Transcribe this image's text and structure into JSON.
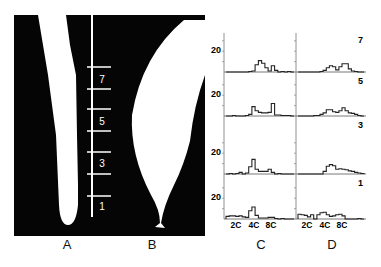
{
  "figure": {
    "panel_labels": [
      "A",
      "B",
      "C",
      "D"
    ],
    "scale_marks": [
      "7",
      "5",
      "3",
      "1"
    ]
  },
  "chart_data": [
    {
      "type": "histogram",
      "panel": "C",
      "rows": [
        {
          "row_label": "7",
          "y_tick": "20",
          "bins": [
            0,
            0,
            0,
            0,
            0,
            0,
            0,
            1,
            2,
            14,
            22,
            17,
            8,
            2,
            12,
            3,
            0,
            1,
            0,
            1,
            0
          ]
        },
        {
          "row_label": "5",
          "y_tick": "20",
          "bins": [
            0,
            0,
            1,
            0,
            0,
            0,
            1,
            3,
            18,
            10,
            7,
            6,
            6,
            7,
            24,
            2,
            2,
            1,
            1,
            1,
            0
          ]
        },
        {
          "row_label": "3",
          "y_tick": "20",
          "bins": [
            0,
            1,
            0,
            1,
            3,
            0,
            2,
            14,
            28,
            9,
            5,
            5,
            5,
            9,
            3,
            0,
            1,
            0,
            0,
            0,
            0
          ]
        },
        {
          "row_label": "1",
          "y_tick": "20",
          "bins": [
            5,
            6,
            6,
            5,
            6,
            4,
            3,
            16,
            23,
            7,
            2,
            2,
            2,
            3,
            3,
            1,
            0,
            1,
            0,
            0,
            0
          ]
        }
      ],
      "x_tick_labels": [
        "2C",
        "4C",
        "8C"
      ],
      "y_tick_labels": [
        "20"
      ],
      "xlabel": "C"
    },
    {
      "type": "histogram",
      "panel": "D",
      "rows": [
        {
          "row_label": "7",
          "bins": [
            0,
            0,
            0,
            0,
            0,
            0,
            0,
            1,
            3,
            8,
            12,
            10,
            4,
            10,
            16,
            16,
            6,
            2,
            1,
            0,
            0
          ]
        },
        {
          "row_label": "5",
          "bins": [
            0,
            0,
            0,
            0,
            0,
            1,
            1,
            3,
            6,
            12,
            12,
            8,
            7,
            10,
            16,
            10,
            6,
            5,
            3,
            1,
            0
          ]
        },
        {
          "row_label": "3",
          "bins": [
            0,
            0,
            0,
            0,
            0,
            0,
            0,
            0,
            5,
            15,
            18,
            16,
            9,
            10,
            9,
            8,
            6,
            5,
            3,
            2,
            1
          ]
        },
        {
          "row_label": "1",
          "bins": [
            9,
            8,
            7,
            4,
            8,
            0,
            8,
            12,
            13,
            8,
            5,
            6,
            8,
            9,
            6,
            0,
            0,
            0,
            0,
            1,
            0
          ]
        }
      ],
      "x_tick_labels": [
        "2C",
        "4C",
        "8C"
      ],
      "xlabel": "D"
    }
  ]
}
